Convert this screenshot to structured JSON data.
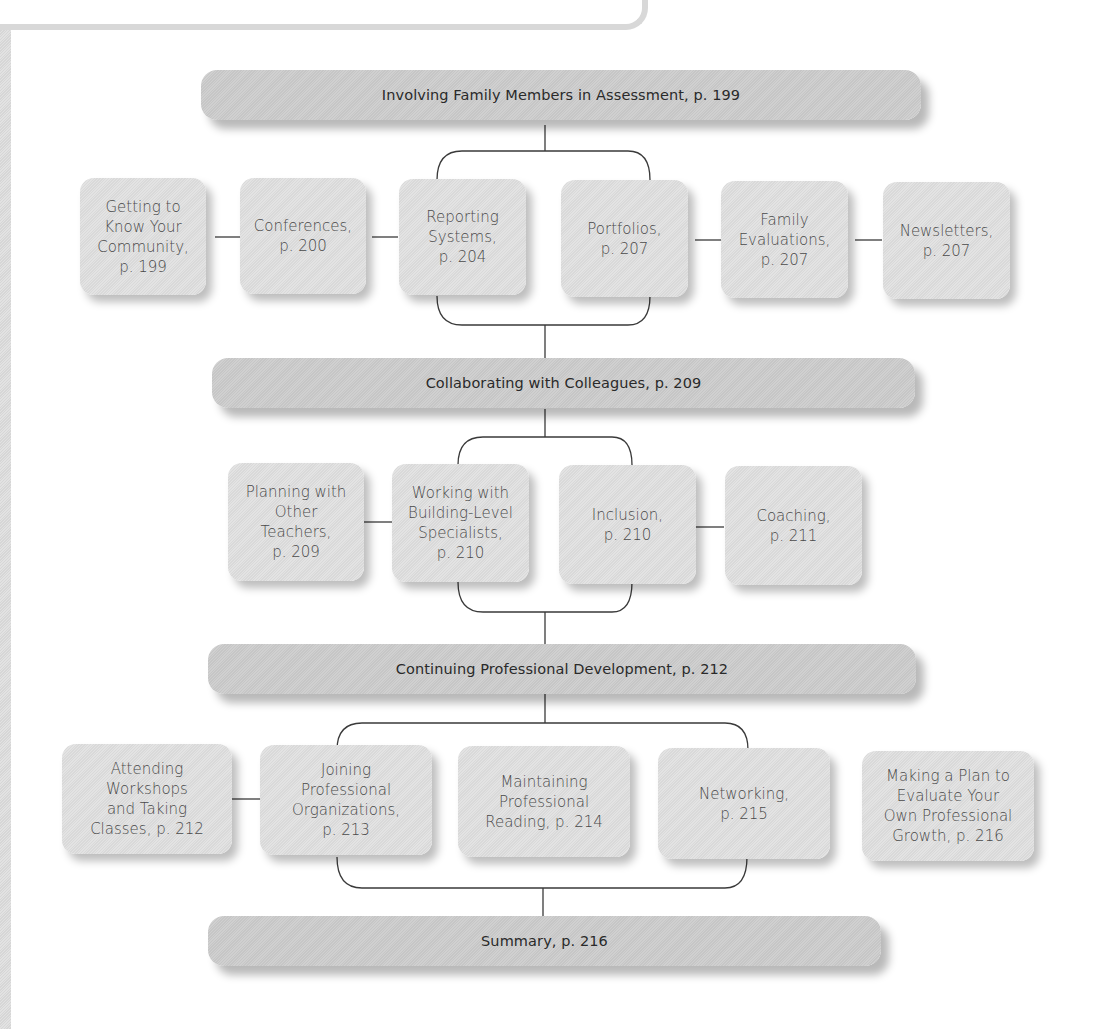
{
  "sections": [
    {
      "title": "Involving Family Members in Assessment, p. 199",
      "items": [
        "Getting to\nKnow Your\nCommunity,\np. 199",
        "Conferences,\np. 200",
        "Reporting\nSystems,\np. 204",
        "Portfolios,\np. 207",
        "Family\nEvaluations,\np. 207",
        "Newsletters,\np. 207"
      ]
    },
    {
      "title": "Collaborating with Colleagues, p. 209",
      "items": [
        "Planning with\nOther\nTeachers,\np. 209",
        "Working with\nBuilding-Level\nSpecialists,\np. 210",
        "Inclusion,\np. 210",
        "Coaching,\np. 211"
      ]
    },
    {
      "title": "Continuing Professional Development, p. 212",
      "items": [
        "Attending\nWorkshops\nand Taking\nClasses, p. 212",
        "Joining\nProfessional\nOrganizations,\np. 213",
        "Maintaining\nProfessional\nReading, p. 214",
        "Networking,\np. 215",
        "Making a Plan to\nEvaluate Your\nOwn Professional\nGrowth, p. 216"
      ]
    },
    {
      "title": "Summary, p. 216",
      "items": []
    }
  ],
  "colors": {
    "header_fill": "#cbcbcb",
    "node_fill": "#dedede",
    "connector": "#3a3a3a",
    "text": "#333333"
  }
}
